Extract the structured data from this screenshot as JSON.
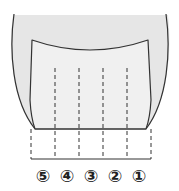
{
  "diagram": {
    "colors": {
      "outer_fill": "#e6e6e6",
      "inner_fill": "#f0f0f0",
      "stroke": "#333333",
      "label": "#222222"
    },
    "section_labels": [
      {
        "id": "5",
        "text": "⑤"
      },
      {
        "id": "4",
        "text": "④"
      },
      {
        "id": "3",
        "text": "③"
      },
      {
        "id": "2",
        "text": "②"
      },
      {
        "id": "1",
        "text": "①"
      }
    ]
  }
}
